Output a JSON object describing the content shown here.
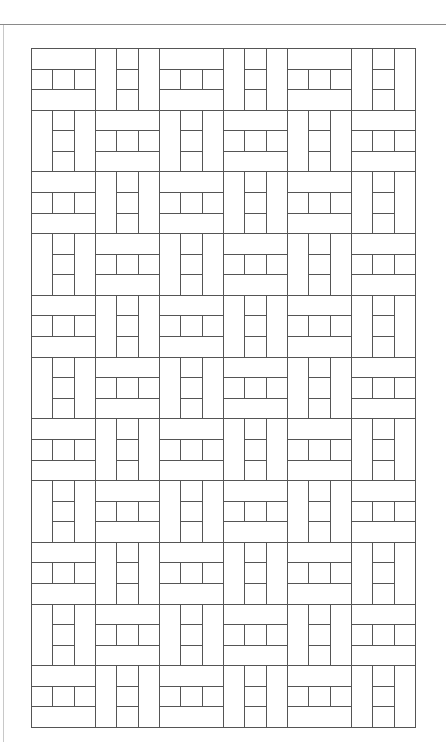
{
  "diagram": {
    "type": "basketweave-tile-pattern",
    "title": "",
    "grid": {
      "columns": 6,
      "rows": 11,
      "block_width": 64,
      "block_height": 61.73,
      "origin_x": 31,
      "origin_y": 48,
      "first_block": "H",
      "alternation": "checkerboard"
    },
    "block_types": {
      "H": "two horizontal bars (top and bottom) with three squares in the middle band",
      "V": "two vertical bars (left and right) with three squares stacked in the middle column"
    },
    "colors": {
      "background": "#ffffff",
      "stroke": "#555555",
      "page_rule": "#8a8a8a",
      "margin_rule": "#c8c8c8"
    },
    "stroke_width": 1
  }
}
